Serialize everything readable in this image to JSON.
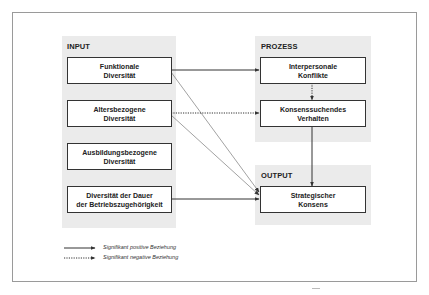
{
  "panels": {
    "input": {
      "title": "INPUT"
    },
    "process": {
      "title": "PROZESS"
    },
    "output": {
      "title": "OUTPUT"
    }
  },
  "nodes": {
    "functional_diversity": "Funktionale\nDiversität",
    "age_diversity": "Altersbezogene\nDiversität",
    "education_diversity": "Ausbildungsbezogene\nDiversität",
    "tenure_diversity": "Diversität der Dauer\nder Betriebszugehörigkeit",
    "interpersonal_conflicts": "Interpersonale\nKonflikte",
    "consensus_seeking": "Konsenssuchendes\nVerhalten",
    "strategic_consensus": "Strategischer\nKonsens"
  },
  "edges": [
    {
      "from": "Funktionale Diversität",
      "to": "Interpersonale Konflikte",
      "type": "positive"
    },
    {
      "from": "Funktionale Diversität",
      "to": "Strategischer Konsens",
      "type": "positive"
    },
    {
      "from": "Altersbezogene Diversität",
      "to": "Konsenssuchendes Verhalten",
      "type": "negative"
    },
    {
      "from": "Altersbezogene Diversität",
      "to": "Strategischer Konsens",
      "type": "positive"
    },
    {
      "from": "Interpersonale Konflikte",
      "to": "Konsenssuchendes Verhalten",
      "type": "negative"
    },
    {
      "from": "Konsenssuchendes Verhalten",
      "to": "Strategischer Konsens",
      "type": "positive"
    },
    {
      "from": "Diversität der Dauer der Betriebszugehörigkeit",
      "to": "Strategischer Konsens",
      "type": "positive"
    }
  ],
  "legend": {
    "positive": "Signifikant positive Beziehung",
    "negative": "Signifikant negative Beziehung"
  },
  "colors": {
    "panel_bg": "#ebebeb",
    "line": "#333333",
    "frame": "#9a9a9a"
  }
}
